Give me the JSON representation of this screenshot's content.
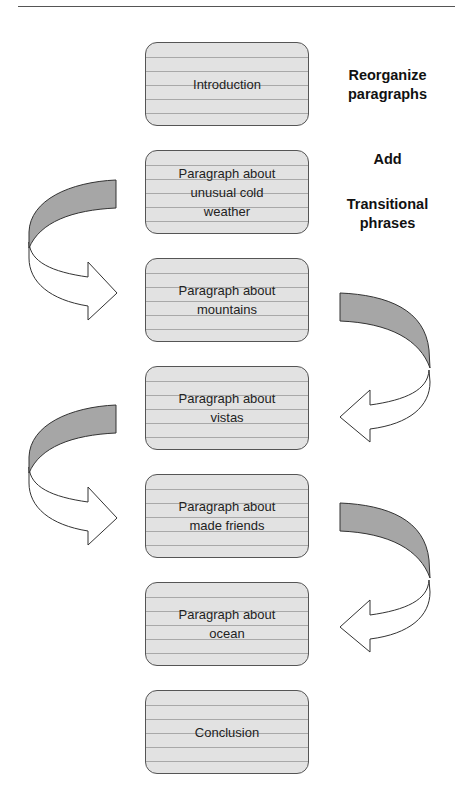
{
  "diagram": {
    "cards": [
      {
        "label": "Introduction"
      },
      {
        "label": "Paragraph about\nunusual cold\nweather"
      },
      {
        "label": "Paragraph about\nmountains"
      },
      {
        "label": "Paragraph about\nvistas"
      },
      {
        "label": "Paragraph about\nmade friends"
      },
      {
        "label": "Paragraph about\nocean"
      },
      {
        "label": "Conclusion"
      }
    ],
    "notes": [
      {
        "text": "Reorganize\nparagraphs"
      },
      {
        "text": "Add"
      },
      {
        "text": "Transitional\nphrases"
      }
    ],
    "arrows": [
      {
        "side": "left",
        "from_card": 1,
        "to_card": 2,
        "icon": "curved-arrow-left-loop"
      },
      {
        "side": "right",
        "from_card": 2,
        "to_card": 3,
        "icon": "curved-arrow-right-loop"
      },
      {
        "side": "left",
        "from_card": 3,
        "to_card": 4,
        "icon": "curved-arrow-left-loop"
      },
      {
        "side": "right",
        "from_card": 4,
        "to_card": 5,
        "icon": "curved-arrow-right-loop"
      }
    ],
    "colors": {
      "card_fill": "#e2e2e2",
      "card_lines": "#a8a8a8",
      "card_border": "#555555",
      "arrow_band": "#a6a6a6",
      "arrow_fill": "#ffffff"
    }
  }
}
